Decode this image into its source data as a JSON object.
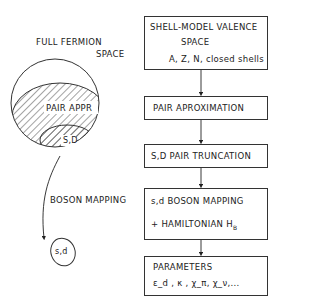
{
  "left": {
    "full_space_line1": "FULL FERMION",
    "full_space_line2": "SPACE",
    "pair_appr": "PAIR APPR",
    "sd": "S,D",
    "boson_mapping": "BOSON MAPPING",
    "boson_space": "s,d"
  },
  "flow": {
    "box1": {
      "line1": "SHELL-MODEL VALENCE",
      "line2": "SPACE",
      "line3": "A, Z, N, closed shells"
    },
    "box2": {
      "line1": "PAIR APROXIMATION"
    },
    "box3": {
      "line1": "S,D PAIR TRUNCATION"
    },
    "box4": {
      "line1": "s,d BOSON MAPPING",
      "line2": "+ HAMILTONIAN  H",
      "line2_sub": "B"
    },
    "box5": {
      "line1": "PARAMETERS",
      "line2": "ε_d , κ , χ_π, χ_ν,..."
    }
  },
  "colors": {
    "ink": "#222222",
    "background": "#ffffff"
  }
}
